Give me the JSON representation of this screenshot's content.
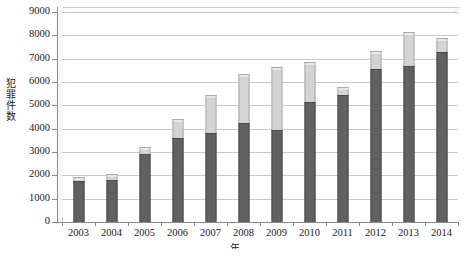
{
  "chart_data": {
    "type": "bar",
    "stacked": true,
    "title": "",
    "xlabel": "年",
    "ylabel": "犯罪件数",
    "ylim": [
      0,
      9000
    ],
    "ytick_step": 1000,
    "yticks": [
      "9000",
      "8000",
      "7000",
      "6000",
      "5000",
      "4000",
      "3000",
      "2000",
      "1000",
      "0"
    ],
    "categories": [
      "2003",
      "2004",
      "2005",
      "2006",
      "2007",
      "2008",
      "2009",
      "2010",
      "2011",
      "2012",
      "2013",
      "2014"
    ],
    "grid": true,
    "legend_position": "bottom",
    "series": [
      {
        "name": "lower-segment",
        "color": "#616161",
        "values": [
          1750,
          1800,
          2900,
          3600,
          3800,
          4250,
          3950,
          5150,
          5450,
          6550,
          6700,
          7300
        ]
      },
      {
        "name": "upper-segment",
        "color": "#d4d4d4",
        "values": [
          200,
          250,
          300,
          800,
          1650,
          2100,
          2700,
          1700,
          350,
          800,
          1450,
          600
        ]
      }
    ],
    "totals": [
      1950,
      2050,
      3200,
      4400,
      5450,
      6350,
      6650,
      6850,
      5800,
      7350,
      8150,
      7900
    ]
  },
  "axes": {
    "y_title": "犯罪件数",
    "y_title_chars": [
      "犯",
      "罪",
      "件",
      "数"
    ],
    "x_title": "年"
  },
  "colors": {
    "lower": "#616161",
    "upper": "#d4d4d4",
    "gridline": "#c9c9c9",
    "axis": "#8a8a8a",
    "background": "#ffffff"
  }
}
